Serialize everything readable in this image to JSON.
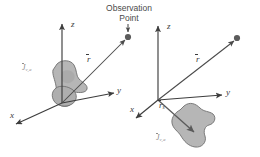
{
  "figure": {
    "width": 260,
    "height": 157,
    "background": "#ffffff",
    "caption_text": "Observation Point",
    "colors": {
      "axis": "#3d3d3d",
      "vector": "#4a4a4a",
      "blob_fill": "#b3b3b3",
      "blob_stroke": "#6e6e6e",
      "blob_shadow": "#9a9a9a",
      "point_dot": "#5c5c5c",
      "label_text": "#3a3a3a",
      "source_label_text": "#8d8d8d"
    }
  },
  "observation": {
    "line1": "Observation",
    "line2": "Point",
    "pointer_icon": "down-arrow-icon"
  },
  "panels": [
    {
      "id": "left",
      "name": "volume-source-at-origin",
      "origin": {
        "x": 62,
        "y": 103
      },
      "axes": [
        {
          "name": "z",
          "label": "z",
          "tip": {
            "x": 62,
            "y": 22
          }
        },
        {
          "name": "y",
          "label": "y",
          "tip": {
            "x": 116,
            "y": 92
          }
        },
        {
          "name": "x",
          "label": "x",
          "tip": {
            "x": 14,
            "y": 126
          }
        }
      ],
      "vectors": [
        {
          "name": "r",
          "label": "r",
          "overbar": true,
          "subscript": "",
          "from": {
            "x": 62,
            "y": 103
          },
          "to": {
            "x": 128,
            "y": 37
          }
        }
      ],
      "source": {
        "label_base": "J",
        "label_subscript": "v,a",
        "overbar": true,
        "position": {
          "x": 26,
          "y": 64
        }
      },
      "observation_dot": {
        "x": 128,
        "y": 37,
        "r": 3.1
      }
    },
    {
      "id": "right",
      "name": "volume-source-offset-from-origin",
      "origin": {
        "x": 158,
        "y": 100
      },
      "axes": [
        {
          "name": "z",
          "label": "z",
          "tip": {
            "x": 158,
            "y": 24
          }
        },
        {
          "name": "y",
          "label": "y",
          "tip": {
            "x": 224,
            "y": 94
          }
        },
        {
          "name": "x",
          "label": "x",
          "tip": {
            "x": 134,
            "y": 120
          }
        }
      ],
      "vectors": [
        {
          "name": "r",
          "label": "r",
          "overbar": true,
          "subscript": "",
          "from": {
            "x": 158,
            "y": 100
          },
          "to": {
            "x": 237,
            "y": 38
          }
        },
        {
          "name": "r_s",
          "label": "r",
          "overbar": true,
          "subscript": "s",
          "from": {
            "x": 158,
            "y": 100
          },
          "to": {
            "x": 196,
            "y": 135
          }
        }
      ],
      "source": {
        "label_base": "J",
        "label_subscript": "v,a",
        "overbar": true,
        "position": {
          "x": 160,
          "y": 134
        }
      },
      "observation_dot": {
        "x": 237,
        "y": 38,
        "r": 3.1
      }
    }
  ]
}
